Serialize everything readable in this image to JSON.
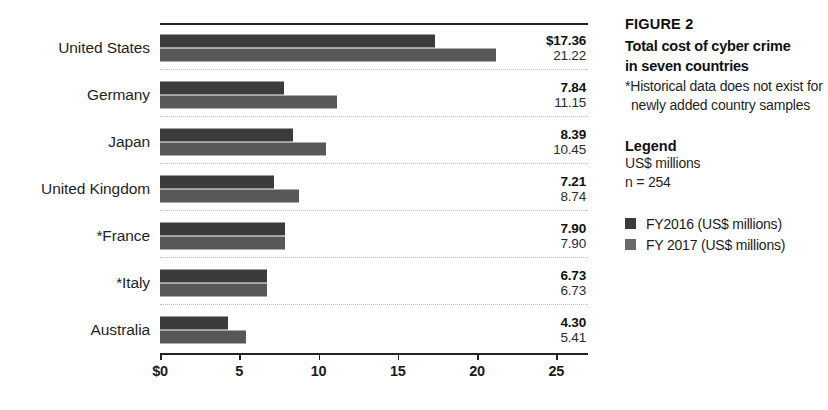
{
  "chart_data": {
    "type": "bar",
    "orientation": "horizontal",
    "title": "Total cost of cyber crime in seven countries",
    "figure_number": "FIGURE 2",
    "xlabel": "",
    "ylabel": "",
    "xlim": [
      0,
      27
    ],
    "grid": false,
    "legend_position": "right",
    "categories": [
      "United States",
      "Germany",
      "Japan",
      "United Kingdom",
      "*France",
      "*Italy",
      "Australia"
    ],
    "series": [
      {
        "name": "FY2016 (US$ millions)",
        "color": "#3b3b3b",
        "values": [
          17.36,
          7.84,
          8.39,
          7.21,
          7.9,
          6.73,
          4.3
        ]
      },
      {
        "name": "FY 2017 (US$ millions)",
        "color": "#585858",
        "values": [
          21.22,
          11.15,
          10.45,
          8.74,
          7.9,
          6.73,
          5.41
        ]
      }
    ],
    "value_labels": [
      {
        "fy2016": "$17.36",
        "fy2017": "21.22"
      },
      {
        "fy2016": "7.84",
        "fy2017": "11.15"
      },
      {
        "fy2016": "8.39",
        "fy2017": "10.45"
      },
      {
        "fy2016": "7.21",
        "fy2017": "8.74"
      },
      {
        "fy2016": "7.90",
        "fy2017": "7.90"
      },
      {
        "fy2016": "6.73",
        "fy2017": "6.73"
      },
      {
        "fy2016": "4.30",
        "fy2017": "5.41"
      }
    ],
    "xticks": [
      0,
      5,
      10,
      15,
      20,
      25
    ],
    "xtick_labels": [
      "$0",
      "5",
      "10",
      "15",
      "20",
      "25"
    ]
  },
  "caption": {
    "figure_number": "FIGURE 2",
    "title_line1": "Total cost of cyber crime",
    "title_line2": "in seven countries",
    "footnote": "*Historical data does not exist for newly added country samples"
  },
  "legend": {
    "heading": "Legend",
    "units": "US$ millions",
    "sample_size": "n = 254",
    "keys": [
      {
        "label": "FY2016 (US$ millions)",
        "color": "#3b3b3b"
      },
      {
        "label": "FY 2017 (US$ millions)",
        "color": "#6a6a6a"
      }
    ]
  }
}
